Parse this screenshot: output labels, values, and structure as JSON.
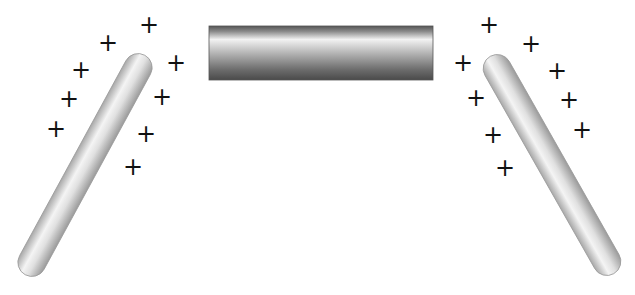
{
  "diagram": {
    "charge_symbol": "+",
    "left_rod": {
      "charges": [
        {
          "x": 149,
          "y": 25
        },
        {
          "x": 108,
          "y": 43
        },
        {
          "x": 176,
          "y": 63
        },
        {
          "x": 81,
          "y": 70
        },
        {
          "x": 162,
          "y": 97
        },
        {
          "x": 69,
          "y": 99
        },
        {
          "x": 146,
          "y": 134
        },
        {
          "x": 56,
          "y": 129
        },
        {
          "x": 133,
          "y": 167
        }
      ]
    },
    "right_rod": {
      "charges": [
        {
          "x": 489,
          "y": 25
        },
        {
          "x": 531,
          "y": 44
        },
        {
          "x": 463,
          "y": 63
        },
        {
          "x": 557,
          "y": 71
        },
        {
          "x": 476,
          "y": 98
        },
        {
          "x": 569,
          "y": 100
        },
        {
          "x": 493,
          "y": 135
        },
        {
          "x": 582,
          "y": 130
        },
        {
          "x": 505,
          "y": 168
        }
      ]
    },
    "center_bar": {
      "x": 209,
      "y": 26,
      "width": 224,
      "height": 54
    }
  }
}
